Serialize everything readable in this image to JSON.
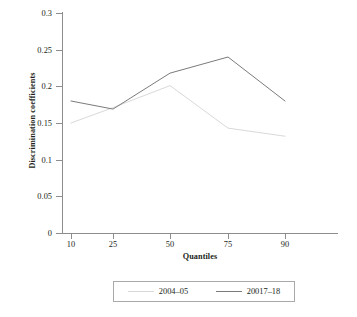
{
  "chart_data": {
    "type": "line",
    "title": "",
    "xlabel": "Quantiles",
    "ylabel": "Discrimination coefficients",
    "categories": [
      "10",
      "25",
      "50",
      "75",
      "90"
    ],
    "x": [
      10,
      25,
      50,
      75,
      90
    ],
    "xtick_labels": [
      "10",
      "25",
      "50",
      "75",
      "90"
    ],
    "ytick_labels": [
      "0",
      "0.05",
      "0.1",
      "0.15",
      "0.2",
      "0.25",
      "0.3"
    ],
    "ytick_values": [
      0,
      0.05,
      0.1,
      0.15,
      0.2,
      0.25,
      0.3
    ],
    "ylim": [
      0,
      0.3
    ],
    "grid": false,
    "legend_position": "bottom",
    "series": [
      {
        "name": "2004–05",
        "color": "#d9d9d9",
        "values": [
          0.15,
          0.171,
          0.201,
          0.143,
          0.132
        ]
      },
      {
        "name": "20017–18",
        "color": "#7b7b7b",
        "values": [
          0.18,
          0.169,
          0.218,
          0.24,
          0.18
        ]
      }
    ]
  },
  "legend": {
    "entries": [
      {
        "label": "2004–05",
        "color": "#d9d9d9"
      },
      {
        "label": "20017–18",
        "color": "#7b7b7b"
      }
    ]
  },
  "axis": {
    "axis_color": "#8d8d8d"
  }
}
